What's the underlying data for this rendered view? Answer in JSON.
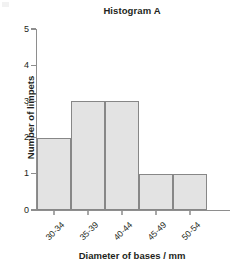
{
  "chart_data": {
    "type": "bar",
    "title": "Histogram A",
    "xlabel": "Diameter of bases / mm",
    "ylabel": "Number of limpets",
    "categories": [
      "30-34",
      "35-39",
      "40-44",
      "45-49",
      "50-54"
    ],
    "values": [
      2,
      3,
      3,
      1,
      1
    ],
    "ylim": [
      0,
      5
    ],
    "yticks": [
      "0",
      "1",
      "2",
      "3",
      "4",
      "5"
    ],
    "grid": false,
    "legend": null,
    "bar_gap": 0,
    "colors": {
      "bar_fill": "#e3e3e3",
      "bar_border": "#878787",
      "axis": "#8e8e8e",
      "text": "#231f20"
    }
  }
}
